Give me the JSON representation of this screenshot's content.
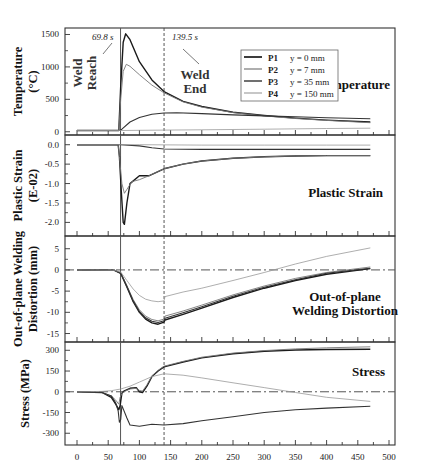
{
  "chart_data": [
    {
      "type": "line",
      "panel": "temperature",
      "title": "Temperature",
      "ylabel": "Temperature (°C)",
      "ylabel_lines": [
        "Temperature",
        "(°C)"
      ],
      "ylim": [
        -50,
        1600
      ],
      "yticks": [
        0,
        500,
        1000,
        1500
      ],
      "xlim": [
        -25,
        525
      ],
      "legend": [
        {
          "name": "P1",
          "desc": "y = 0 mm",
          "color": "#1a1a1a",
          "width": 1.4
        },
        {
          "name": "P2",
          "desc": "y = 7 mm",
          "color": "#777777",
          "width": 0.9
        },
        {
          "name": "P3",
          "desc": "y = 35 mm",
          "color": "#333333",
          "width": 1.1
        },
        {
          "name": "P4",
          "desc": "y = 150 mm",
          "color": "#999999",
          "width": 0.8
        }
      ],
      "series": [
        {
          "name": "P1",
          "x": [
            0,
            67,
            70,
            74,
            78,
            85,
            100,
            120,
            139.5,
            170,
            200,
            250,
            300,
            350,
            400,
            470
          ],
          "y": [
            20,
            20,
            700,
            1380,
            1510,
            1420,
            1080,
            800,
            620,
            470,
            390,
            300,
            250,
            210,
            180,
            150
          ]
        },
        {
          "name": "P2",
          "x": [
            0,
            67,
            70,
            74,
            79,
            85,
            100,
            120,
            139.5,
            170,
            200,
            250,
            300,
            350,
            400,
            470
          ],
          "y": [
            20,
            20,
            500,
            930,
            1040,
            1010,
            880,
            720,
            600,
            460,
            380,
            295,
            245,
            205,
            175,
            140
          ]
        },
        {
          "name": "P3",
          "x": [
            0,
            68,
            72,
            85,
            100,
            120,
            139.5,
            160,
            200,
            250,
            300,
            350,
            400,
            470
          ],
          "y": [
            20,
            20,
            40,
            150,
            220,
            270,
            290,
            292,
            280,
            260,
            245,
            230,
            215,
            200
          ]
        },
        {
          "name": "P4",
          "x": [
            0,
            70,
            100,
            200,
            300,
            400,
            470
          ],
          "y": [
            20,
            20,
            22,
            30,
            40,
            50,
            55
          ]
        }
      ],
      "annotations": [
        {
          "text": "69.8 s",
          "x": 69.8
        },
        {
          "text": "139.5 s",
          "x": 139.5
        },
        {
          "text": "Weld Reach"
        },
        {
          "text": "Weld End"
        }
      ]
    },
    {
      "type": "line",
      "panel": "plastic_strain",
      "title": "Plastic Strain",
      "ylabel": "Plastic Strain (E-02)",
      "ylabel_lines": [
        "Plastic Strain",
        "(E-02)"
      ],
      "ylim": [
        -2.35,
        0.25
      ],
      "yticks": [
        0.0,
        -0.5,
        -1.0,
        -1.5,
        -2.0
      ],
      "ytick_labels": [
        "0.0",
        "-0.5",
        "-1.0",
        "-1.5",
        "-2.0"
      ],
      "series": [
        {
          "name": "P1",
          "x": [
            0,
            66,
            68,
            71,
            74,
            76,
            80,
            85,
            100,
            115,
            139.5,
            170,
            200,
            250,
            300,
            350,
            400,
            470
          ],
          "y": [
            0,
            0,
            -0.3,
            -1.2,
            -2.0,
            -2.05,
            -1.5,
            -1.0,
            -0.8,
            -0.8,
            -0.62,
            -0.5,
            -0.42,
            -0.35,
            -0.31,
            -0.29,
            -0.28,
            -0.28
          ]
        },
        {
          "name": "P2",
          "x": [
            0,
            66,
            68,
            72,
            76,
            80,
            88,
            100,
            115,
            139.5,
            170,
            200,
            250,
            300,
            350,
            400,
            470
          ],
          "y": [
            0,
            0,
            -0.3,
            -1.0,
            -1.25,
            -1.15,
            -0.95,
            -0.9,
            -0.8,
            -0.62,
            -0.5,
            -0.42,
            -0.35,
            -0.31,
            -0.29,
            -0.28,
            -0.28
          ]
        },
        {
          "name": "P3",
          "x": [
            0,
            70,
            100,
            120,
            139.5,
            200,
            300,
            400,
            470
          ],
          "y": [
            0,
            0,
            -0.03,
            -0.08,
            -0.11,
            -0.12,
            -0.12,
            -0.12,
            -0.12
          ]
        },
        {
          "name": "P4",
          "x": [
            0,
            100,
            200,
            300,
            400,
            470
          ],
          "y": [
            0,
            0,
            -0.01,
            -0.01,
            -0.01,
            -0.01
          ]
        }
      ]
    },
    {
      "type": "line",
      "panel": "distortion",
      "title": "Out-of-plane Welding Distortion",
      "title_lines": [
        "Out-of-plane",
        "Welding Distortion"
      ],
      "ylabel": "Out-of-plane Welding Distortion (mm)",
      "ylabel_lines": [
        "Out-of-plane Welding",
        "Distortion (mm)"
      ],
      "ylim": [
        -17,
        8
      ],
      "yticks": [
        5,
        0,
        -5,
        -10,
        -15
      ],
      "reference_line": 0,
      "series": [
        {
          "name": "P1",
          "x": [
            0,
            60,
            70,
            80,
            90,
            100,
            110,
            120,
            130,
            139.5,
            141,
            170,
            200,
            250,
            300,
            350,
            400,
            470
          ],
          "y": [
            0,
            -0.1,
            -0.8,
            -4.0,
            -7.5,
            -10.0,
            -11.6,
            -12.5,
            -12.8,
            -12.3,
            -11.8,
            -10.5,
            -9.0,
            -6.5,
            -4.3,
            -2.5,
            -1.0,
            0.3
          ]
        },
        {
          "name": "P2",
          "x": [
            0,
            60,
            70,
            80,
            90,
            100,
            110,
            120,
            130,
            139.5,
            141,
            170,
            200,
            250,
            300,
            350,
            400,
            470
          ],
          "y": [
            0,
            -0.1,
            -0.7,
            -3.7,
            -7.0,
            -9.4,
            -10.9,
            -11.7,
            -12.0,
            -11.6,
            -10.9,
            -9.7,
            -8.3,
            -5.9,
            -3.8,
            -2.0,
            -0.6,
            0.7
          ]
        },
        {
          "name": "P3",
          "x": [
            0,
            60,
            70,
            80,
            90,
            100,
            110,
            120,
            130,
            139.5,
            141,
            170,
            200,
            250,
            300,
            350,
            400,
            470
          ],
          "y": [
            0,
            -0.1,
            -0.8,
            -3.9,
            -7.3,
            -9.8,
            -11.3,
            -12.1,
            -12.4,
            -12.0,
            -11.4,
            -10.1,
            -8.7,
            -6.2,
            -4.1,
            -2.3,
            -0.8,
            0.4
          ]
        },
        {
          "name": "P4",
          "x": [
            0,
            60,
            70,
            80,
            90,
            100,
            110,
            120,
            130,
            139.5,
            141,
            170,
            200,
            250,
            300,
            350,
            400,
            470
          ],
          "y": [
            0,
            -0.1,
            -0.5,
            -2.5,
            -4.5,
            -6.0,
            -6.9,
            -7.3,
            -7.5,
            -7.3,
            -6.3,
            -5.2,
            -4.3,
            -2.5,
            -0.6,
            1.4,
            3.2,
            5.2
          ]
        }
      ]
    },
    {
      "type": "line",
      "panel": "stress",
      "title": "Stress",
      "ylabel": "Stress (MPa)",
      "ylabel_lines": [
        "Stress (MPa)"
      ],
      "ylim": [
        -385,
        360
      ],
      "yticks": [
        300,
        150,
        0,
        -150,
        -300
      ],
      "xlabel": "",
      "xticks": [
        0,
        50,
        100,
        150,
        200,
        250,
        300,
        350,
        400,
        450,
        500
      ],
      "reference_line": 0,
      "series": [
        {
          "name": "P1",
          "x": [
            0,
            40,
            55,
            62,
            67,
            69,
            72,
            75,
            85,
            95,
            100,
            105,
            112,
            120,
            130,
            139.5,
            170,
            200,
            250,
            300,
            350,
            400,
            470
          ],
          "y": [
            0,
            -5,
            -40,
            -90,
            -130,
            -100,
            -10,
            5,
            25,
            30,
            0,
            -5,
            40,
            110,
            150,
            180,
            215,
            245,
            275,
            293,
            302,
            306,
            308
          ]
        },
        {
          "name": "P2",
          "x": [
            0,
            40,
            55,
            62,
            67,
            69,
            72,
            75,
            85,
            95,
            100,
            105,
            112,
            120,
            130,
            139.5,
            170,
            200,
            250,
            300,
            350,
            400,
            470
          ],
          "y": [
            0,
            -5,
            -30,
            -60,
            -90,
            -40,
            -15,
            0,
            20,
            25,
            10,
            5,
            50,
            115,
            155,
            185,
            220,
            250,
            280,
            298,
            310,
            318,
            325
          ]
        },
        {
          "name": "P3",
          "x": [
            0,
            40,
            55,
            62,
            66,
            68,
            70,
            72,
            80,
            85,
            100,
            120,
            139.5,
            170,
            200,
            250,
            300,
            350,
            400,
            470
          ],
          "y": [
            0,
            -5,
            -30,
            -80,
            -140,
            -220,
            -200,
            -100,
            -190,
            -240,
            -250,
            -235,
            -240,
            -230,
            -210,
            -180,
            -150,
            -130,
            -118,
            -105
          ]
        },
        {
          "name": "P4",
          "x": [
            0,
            40,
            55,
            70,
            85,
            100,
            120,
            139.5,
            170,
            200,
            250,
            300,
            350,
            400,
            470
          ],
          "y": [
            0,
            3,
            8,
            20,
            40,
            70,
            110,
            130,
            120,
            100,
            65,
            30,
            -5,
            -40,
            -70
          ]
        }
      ]
    }
  ],
  "labels": {
    "annotation_reach_time": "69.8 s",
    "annotation_end_time": "139.5 s",
    "weld_reach_line1": "Weld",
    "weld_reach_line2": "Reach",
    "weld_end_line1": "Weld",
    "weld_end_line2": "End"
  }
}
